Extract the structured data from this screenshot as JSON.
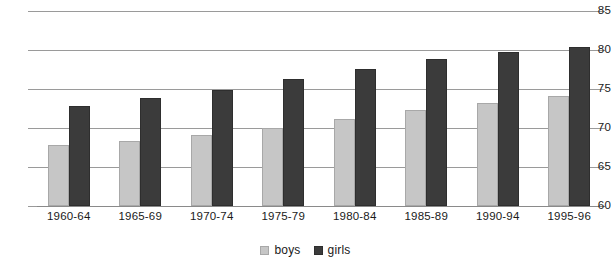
{
  "chart_data": {
    "type": "bar",
    "title": "",
    "subtitle": "",
    "xlabel": "",
    "ylabel": "",
    "categories": [
      "1960-64",
      "1965-69",
      "1970-74",
      "1975-79",
      "1980-84",
      "1985-89",
      "1990-94",
      "1995-96"
    ],
    "series": [
      {
        "name": "boys",
        "color": "#c6c6c6",
        "values": [
          67.8,
          68.3,
          69.1,
          70.0,
          71.1,
          72.3,
          73.2,
          74.1
        ]
      },
      {
        "name": "girls",
        "color": "#3b3b3b",
        "values": [
          72.8,
          73.9,
          74.9,
          76.3,
          77.6,
          78.9,
          79.8,
          80.4
        ]
      }
    ],
    "ylim": [
      60,
      85
    ],
    "yticks": [
      60,
      65,
      70,
      75,
      80,
      85
    ],
    "ytick_labels": [
      "60",
      "65",
      "70",
      "75",
      "80",
      "85"
    ],
    "grid": true,
    "legend_position": "bottom-center",
    "legend_entries": [
      "boys",
      "girls"
    ]
  }
}
